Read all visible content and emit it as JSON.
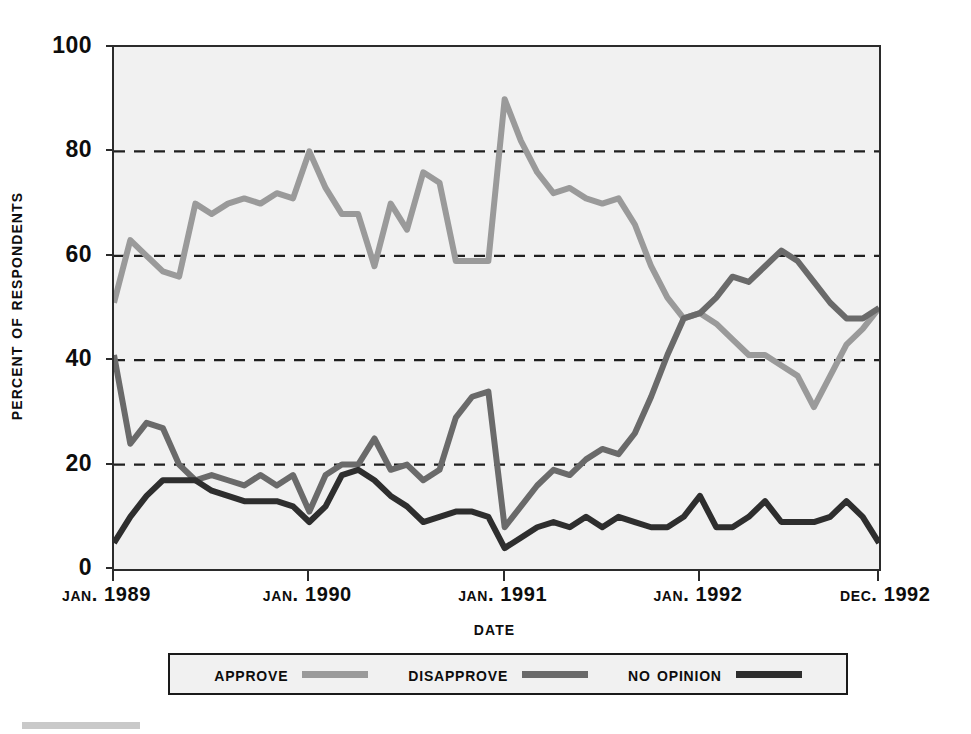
{
  "chart_data": {
    "type": "line",
    "title": "",
    "xlabel": "Date",
    "ylabel": "Percent of Respondents",
    "ylim": [
      0,
      100
    ],
    "yticks": [
      0,
      20,
      40,
      60,
      80,
      100
    ],
    "grid": "dashed horizontal gridlines at 20, 40, 60, 80",
    "legend_position": "below plot, centered, boxed",
    "xlim_labels": [
      "Jan. 1989",
      "Jan. 1990",
      "Jan. 1991",
      "Jan. 1992",
      "Dec. 1992"
    ],
    "xtick_labels": [
      "Jan. 1989",
      "Jan. 1990",
      "Jan. 1991",
      "Jan. 1992",
      "Dec. 1992"
    ],
    "x_count": 48,
    "x": [
      "Jan 1989",
      "Feb 1989",
      "Mar 1989",
      "Apr 1989",
      "May 1989",
      "Jun 1989",
      "Jul 1989",
      "Aug 1989",
      "Sep 1989",
      "Oct 1989",
      "Nov 1989",
      "Dec 1989",
      "Jan 1990",
      "Feb 1990",
      "Mar 1990",
      "Apr 1990",
      "May 1990",
      "Jun 1990",
      "Jul 1990",
      "Aug 1990",
      "Sep 1990",
      "Oct 1990",
      "Nov 1990",
      "Dec 1990",
      "Jan 1991",
      "Feb 1991",
      "Mar 1991",
      "Apr 1991",
      "May 1991",
      "Jun 1991",
      "Jul 1991",
      "Aug 1991",
      "Sep 1991",
      "Oct 1991",
      "Nov 1991",
      "Dec 1991",
      "Jan 1992",
      "Feb 1992",
      "Mar 1992",
      "Apr 1992",
      "May 1992",
      "Jun 1992",
      "Jul 1992",
      "Aug 1992",
      "Sep 1992",
      "Oct 1992",
      "Nov 1992",
      "Dec 1992"
    ],
    "series": [
      {
        "name": "Approve",
        "color": "#9a9a9a",
        "values": [
          51,
          63,
          60,
          57,
          56,
          70,
          68,
          70,
          71,
          70,
          72,
          71,
          80,
          73,
          68,
          68,
          58,
          70,
          65,
          76,
          74,
          59,
          59,
          59,
          90,
          82,
          76,
          72,
          73,
          71,
          70,
          71,
          66,
          58,
          52,
          48,
          49,
          47,
          44,
          41,
          41,
          39,
          37,
          31,
          37,
          43,
          46,
          50
        ]
      },
      {
        "name": "Disapprove",
        "color": "#6a6a6a",
        "values": [
          41,
          24,
          28,
          27,
          20,
          17,
          18,
          17,
          16,
          18,
          16,
          18,
          11,
          18,
          20,
          20,
          25,
          19,
          20,
          17,
          19,
          29,
          33,
          34,
          8,
          12,
          16,
          19,
          18,
          21,
          23,
          22,
          26,
          33,
          41,
          48,
          49,
          52,
          56,
          55,
          58,
          61,
          59,
          55,
          51,
          48,
          48,
          50
        ]
      },
      {
        "name": "No opinion",
        "color": "#2e2e2e",
        "values": [
          5,
          10,
          14,
          17,
          17,
          17,
          15,
          14,
          13,
          13,
          13,
          12,
          9,
          12,
          18,
          19,
          17,
          14,
          12,
          9,
          10,
          11,
          11,
          10,
          4,
          6,
          8,
          9,
          8,
          10,
          8,
          10,
          9,
          8,
          8,
          10,
          14,
          8,
          8,
          10,
          13,
          9,
          9,
          9,
          10,
          13,
          10,
          5
        ]
      }
    ]
  },
  "axes": {
    "y_ticks": [
      {
        "label": "100",
        "value": 100
      },
      {
        "label": "80",
        "value": 80
      },
      {
        "label": "60",
        "value": 60
      },
      {
        "label": "40",
        "value": 40
      },
      {
        "label": "20",
        "value": 20
      },
      {
        "label": "0",
        "value": 0
      }
    ],
    "y_title": "Percent of Respondents",
    "x_title": "Date",
    "x_ticks": [
      {
        "label": "Jan. 1989"
      },
      {
        "label": "Jan. 1990"
      },
      {
        "label": "Jan. 1991"
      },
      {
        "label": "Jan. 1992"
      },
      {
        "label": "Dec. 1992"
      }
    ]
  },
  "legend": {
    "items": [
      {
        "label": "Approve",
        "color": "#9a9a9a"
      },
      {
        "label": "Disapprove",
        "color": "#6a6a6a"
      },
      {
        "label": "No opinion",
        "color": "#2e2e2e"
      }
    ]
  },
  "style": {
    "plot_background": "#f1f1f1",
    "axis_color": "#2b2b2b",
    "gridline_color": "#1f1f1f",
    "page_background": "#ffffff"
  }
}
